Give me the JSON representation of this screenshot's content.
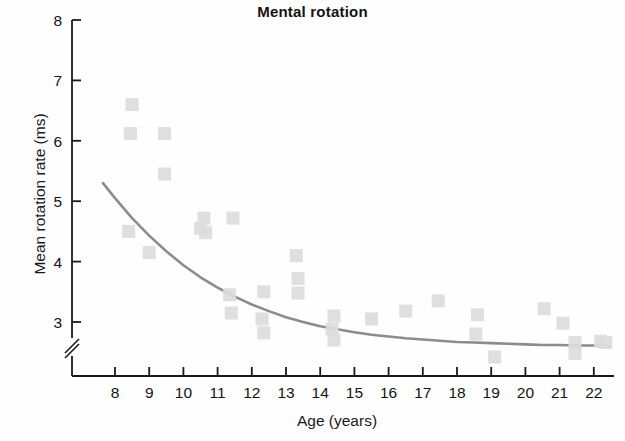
{
  "chart_data": {
    "type": "scatter",
    "title": "Mental rotation",
    "xlabel": "Age (years)",
    "ylabel": "Mean rotation rate (ms)",
    "xlim": [
      7.4,
      22.6
    ],
    "ylim": [
      2.25,
      8.0
    ],
    "grid": false,
    "legend": null,
    "y_axis_break": true,
    "y_axis_break_note": "axis break between 3 and the axis origin",
    "xticks": [
      8,
      9,
      10,
      11,
      12,
      13,
      14,
      15,
      16,
      17,
      18,
      19,
      20,
      21,
      22
    ],
    "xtick_labels": [
      "8",
      "9",
      "10",
      "11",
      "12",
      "13",
      "14",
      "15",
      "16",
      "17",
      "18",
      "19",
      "20",
      "21",
      "22"
    ],
    "yticks": [
      3,
      4,
      5,
      6,
      7,
      8
    ],
    "ytick_labels": [
      "3",
      "4",
      "5",
      "6",
      "7",
      "8"
    ],
    "marker": "square",
    "marker_color": "#dcdcdc",
    "curve_color": "#8c8c8c",
    "axis_color": "#1a1a1a",
    "points": [
      {
        "x": 8.5,
        "y": 6.6
      },
      {
        "x": 8.45,
        "y": 6.12
      },
      {
        "x": 9.45,
        "y": 6.12
      },
      {
        "x": 9.45,
        "y": 5.45
      },
      {
        "x": 8.4,
        "y": 4.5
      },
      {
        "x": 9.0,
        "y": 4.15
      },
      {
        "x": 10.6,
        "y": 4.72
      },
      {
        "x": 10.5,
        "y": 4.55
      },
      {
        "x": 10.65,
        "y": 4.48
      },
      {
        "x": 11.45,
        "y": 4.72
      },
      {
        "x": 11.35,
        "y": 3.45
      },
      {
        "x": 11.4,
        "y": 3.15
      },
      {
        "x": 12.35,
        "y": 3.5
      },
      {
        "x": 12.3,
        "y": 3.05
      },
      {
        "x": 12.35,
        "y": 2.82
      },
      {
        "x": 13.3,
        "y": 4.1
      },
      {
        "x": 13.35,
        "y": 3.72
      },
      {
        "x": 13.35,
        "y": 3.48
      },
      {
        "x": 14.4,
        "y": 3.1
      },
      {
        "x": 14.35,
        "y": 2.88
      },
      {
        "x": 14.4,
        "y": 2.7
      },
      {
        "x": 15.5,
        "y": 3.05
      },
      {
        "x": 16.5,
        "y": 3.18
      },
      {
        "x": 17.45,
        "y": 3.35
      },
      {
        "x": 18.6,
        "y": 3.12
      },
      {
        "x": 18.55,
        "y": 2.8
      },
      {
        "x": 19.1,
        "y": 2.42
      },
      {
        "x": 20.55,
        "y": 3.22
      },
      {
        "x": 21.1,
        "y": 2.98
      },
      {
        "x": 21.45,
        "y": 2.66
      },
      {
        "x": 21.45,
        "y": 2.48
      },
      {
        "x": 22.2,
        "y": 2.68
      },
      {
        "x": 22.35,
        "y": 2.66
      }
    ],
    "fit_curve": {
      "description": "decaying exponential trend line",
      "x": [
        7.65,
        8.0,
        8.5,
        9.0,
        9.5,
        10.0,
        10.5,
        11.0,
        11.5,
        12.0,
        12.5,
        13.0,
        13.5,
        14.0,
        14.5,
        15.0,
        15.5,
        16.0,
        16.5,
        17.0,
        17.5,
        18.0,
        18.5,
        19.0,
        19.5,
        20.0,
        20.5,
        21.0,
        21.5,
        22.0,
        22.45
      ],
      "y": [
        5.3,
        5.05,
        4.72,
        4.43,
        4.17,
        3.94,
        3.74,
        3.57,
        3.42,
        3.29,
        3.18,
        3.08,
        3.0,
        2.93,
        2.88,
        2.83,
        2.79,
        2.76,
        2.73,
        2.71,
        2.69,
        2.67,
        2.66,
        2.65,
        2.64,
        2.63,
        2.62,
        2.62,
        2.61,
        2.61,
        2.6
      ]
    }
  }
}
